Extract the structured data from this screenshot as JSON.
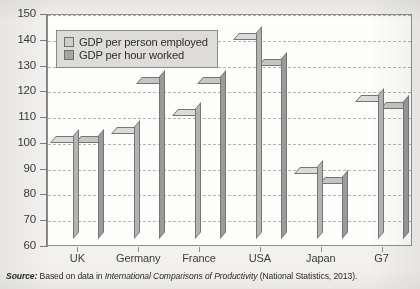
{
  "chart_data": {
    "type": "bar",
    "title": "",
    "subtitle": "",
    "xlabel": "",
    "ylabel": "",
    "ylim": [
      60,
      150
    ],
    "ytick_step": 10,
    "yticks": [
      150,
      140,
      130,
      120,
      110,
      100,
      90,
      80,
      70,
      60
    ],
    "grid": true,
    "grid_style": "dashed-horizontal",
    "legend_position": "top-left-inside",
    "categories": [
      "UK",
      "Germany",
      "France",
      "USA",
      "Japan",
      "G7"
    ],
    "series": [
      {
        "name": "GDP per person employed",
        "color": "#c3c2c0",
        "values": [
          100,
          103.5,
          110.5,
          140,
          88,
          116
        ]
      },
      {
        "name": "GDP per hour worked",
        "color": "#a9a8a6",
        "values": [
          100,
          123,
          123,
          130,
          84,
          113
        ]
      }
    ]
  },
  "legend": {
    "items": [
      {
        "label": "GDP per person employed",
        "swatch": "#cfcecc"
      },
      {
        "label": "GDP per hour worked",
        "swatch": "#a5a4a2"
      }
    ]
  },
  "source": {
    "prefix": "Source:",
    "lead": "Based on data in",
    "title": "International Comparisons of Productivity",
    "publisher": "(National Statistics, 2013)."
  },
  "colors": {
    "series_light": "#c3c2c0",
    "series_dark": "#a9a8a6",
    "bar_outline": "#757575",
    "plot_background": "#fdfdfc",
    "page_background": "#f2f1ef",
    "gridline": "#b3b3b3",
    "legend_background": "#dedcda"
  }
}
